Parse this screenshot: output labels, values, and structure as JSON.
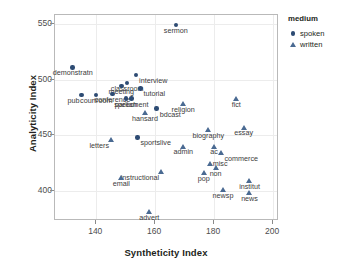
{
  "chart_data": {
    "type": "scatter",
    "title": "",
    "xlabel": "Syntheticity Index",
    "ylabel": "Analyticity Index",
    "xlim": [
      126,
      202
    ],
    "ylim": [
      373,
      558
    ],
    "xticks": [
      140,
      160,
      180,
      200
    ],
    "yticks": [
      400,
      450,
      500,
      550
    ],
    "grid": true,
    "legend": {
      "title": "medium",
      "position": "right",
      "entries": [
        {
          "label": "spoken",
          "marker": "circle",
          "color": "#2d4b73"
        },
        {
          "label": "written",
          "marker": "triangle",
          "color": "#4a6a92"
        }
      ]
    },
    "series": [
      {
        "name": "spoken",
        "marker": "circle",
        "color": "#2d4b73",
        "points": [
          {
            "label": "sermon",
            "x": 167.0,
            "y": 549.0,
            "pos": "below"
          },
          {
            "label": "demonstratn",
            "x": 132.0,
            "y": 511.0,
            "pos": "below"
          },
          {
            "label": "interview",
            "x": 153.5,
            "y": 504.0,
            "pos": "below-right"
          },
          {
            "label": "classroom",
            "x": 150.5,
            "y": 497.0,
            "pos": "below"
          },
          {
            "label": "meeting",
            "x": 148.5,
            "y": 494.0,
            "pos": "below"
          },
          {
            "label": "tutorial",
            "x": 155.0,
            "y": 492.0,
            "pos": "below-right"
          },
          {
            "label": "pub",
            "x": 135.0,
            "y": 486.0,
            "pos": "below-left"
          },
          {
            "label": "courtroom",
            "x": 140.0,
            "y": 486.0,
            "pos": "below"
          },
          {
            "label": "conference",
            "x": 145.5,
            "y": 487.0,
            "pos": "below"
          },
          {
            "label": "speech",
            "x": 150.0,
            "y": 483.0,
            "pos": "below"
          },
          {
            "label": "parliament",
            "x": 152.0,
            "y": 483.0,
            "pos": "below"
          },
          {
            "label": "bdcast",
            "x": 160.5,
            "y": 474.0,
            "pos": "below-right"
          },
          {
            "label": "sportslive",
            "x": 154.0,
            "y": 448.0,
            "pos": "below-right"
          }
        ]
      },
      {
        "name": "written",
        "marker": "triangle",
        "color": "#4a6a92",
        "points": [
          {
            "label": "fict",
            "x": 187.5,
            "y": 483.0,
            "pos": "below"
          },
          {
            "label": "religion",
            "x": 169.5,
            "y": 478.0,
            "pos": "below"
          },
          {
            "label": "hansard",
            "x": 156.5,
            "y": 470.0,
            "pos": "below"
          },
          {
            "label": "essay",
            "x": 190.0,
            "y": 457.0,
            "pos": "below"
          },
          {
            "label": "biography",
            "x": 178.0,
            "y": 455.0,
            "pos": "below"
          },
          {
            "label": "letters",
            "x": 145.0,
            "y": 446.0,
            "pos": "below-left"
          },
          {
            "label": "admin",
            "x": 169.5,
            "y": 440.0,
            "pos": "below"
          },
          {
            "label": "ac",
            "x": 180.0,
            "y": 440.0,
            "pos": "below"
          },
          {
            "label": "commerce",
            "x": 182.5,
            "y": 434.0,
            "pos": "below-right"
          },
          {
            "label": "misc",
            "x": 178.5,
            "y": 424.0,
            "pos": "right"
          },
          {
            "label": "non",
            "x": 180.5,
            "y": 421.0,
            "pos": "below"
          },
          {
            "label": "instructional",
            "x": 162.0,
            "y": 417.0,
            "pos": "below-left"
          },
          {
            "label": "pop",
            "x": 176.5,
            "y": 416.0,
            "pos": "below"
          },
          {
            "label": "email",
            "x": 148.5,
            "y": 412.0,
            "pos": "below"
          },
          {
            "label": "institut",
            "x": 192.0,
            "y": 409.0,
            "pos": "below"
          },
          {
            "label": "newsp",
            "x": 183.0,
            "y": 401.0,
            "pos": "below"
          },
          {
            "label": "news",
            "x": 192.0,
            "y": 398.0,
            "pos": "below"
          },
          {
            "label": "advert",
            "x": 158.0,
            "y": 381.0,
            "pos": "below"
          }
        ]
      }
    ]
  }
}
